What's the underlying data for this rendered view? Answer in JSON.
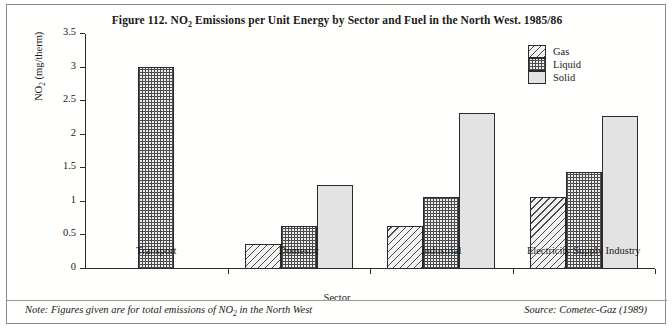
{
  "figure": {
    "title_prefix": "Figure 112.  NO",
    "title_sub": "2",
    "title_suffix": " Emissions per Unit Energy by Sector and Fuel in the North West. 1985/86",
    "note_prefix": "Note: Figures given are for total emissions of NO",
    "note_sub": "2",
    "note_suffix": " in the North West",
    "source": "Source: Cometec-Gaz (1989)"
  },
  "axes": {
    "ylabel_prefix": "NO",
    "ylabel_sub": "2",
    "ylabel_suffix": " (mg/therm)",
    "xlabel": "Sector",
    "yticks": [
      "0",
      "0.5",
      "1",
      "1.5",
      "2",
      "2.5",
      "3",
      "3.5"
    ]
  },
  "legend": {
    "items": [
      {
        "label": "Gas",
        "pattern": "diagonal-hatch",
        "color": "#f2f2f2"
      },
      {
        "label": "Liquid",
        "pattern": "cross-hatch",
        "color": "#ededed"
      },
      {
        "label": "Solid",
        "pattern": "plain-fill",
        "color": "#e3e3e3"
      }
    ]
  },
  "chart_data": {
    "type": "bar",
    "title": "Figure 112.  NO2 Emissions per Unit Energy by Sector and Fuel in the North West. 1985/86",
    "xlabel": "Sector",
    "ylabel": "NO2 (mg/therm)",
    "ylim": [
      0,
      3.5
    ],
    "ytick_step": 0.5,
    "grid": false,
    "legend_position": "top-right",
    "categories": [
      "Transport",
      "Domestic",
      "Industrial",
      "Electricity Supply Industry"
    ],
    "series": [
      {
        "name": "Gas",
        "values": [
          null,
          0.38,
          0.64,
          1.08
        ]
      },
      {
        "name": "Liquid",
        "values": [
          3.01,
          0.64,
          1.08,
          1.45
        ]
      },
      {
        "name": "Solid",
        "values": [
          null,
          1.25,
          2.32,
          2.28
        ]
      }
    ],
    "note": "Note: Figures given are for total emissions of NO2 in the North West",
    "source": "Source: Cometec-Gaz (1989)"
  }
}
